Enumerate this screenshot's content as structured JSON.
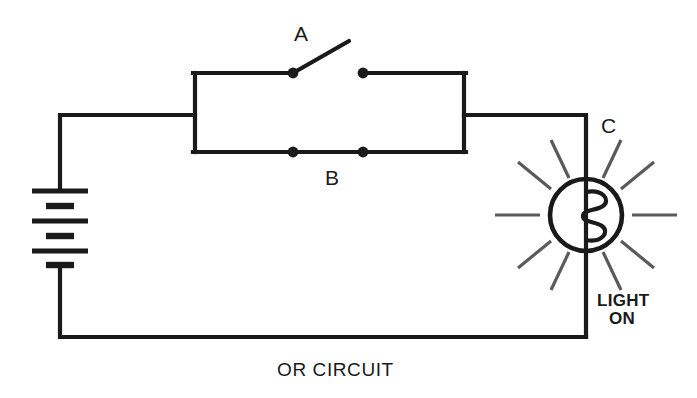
{
  "diagram": {
    "caption": "OR CIRCUIT",
    "stroke_color": "#1a1a1a",
    "background_color": "#ffffff",
    "labels": {
      "switch_a": "A",
      "switch_b": "B",
      "lamp_c": "C"
    },
    "status": {
      "line1": "LIGHT",
      "line2": "ON"
    },
    "components": [
      {
        "name": "battery",
        "type": "dc-battery",
        "cells": 3,
        "plates": 6,
        "position": {
          "x": 60,
          "y": 227
        }
      },
      {
        "name": "switch-a",
        "type": "spst-switch",
        "state": "open",
        "label": "A",
        "position": {
          "x": 328,
          "y": 73
        }
      },
      {
        "name": "switch-b",
        "type": "spst-switch",
        "state": "closed",
        "label": "B",
        "position": {
          "x": 328,
          "y": 152
        }
      },
      {
        "name": "lamp-c",
        "type": "incandescent-lamp",
        "state": "on",
        "label": "C",
        "position": {
          "x": 586,
          "y": 215
        }
      }
    ],
    "topology": {
      "description": "Two switches A and B wired in parallel between the battery and the lamp",
      "parallel_branch_box": {
        "x": 195,
        "y": 73,
        "width": 269,
        "height": 79
      }
    }
  }
}
